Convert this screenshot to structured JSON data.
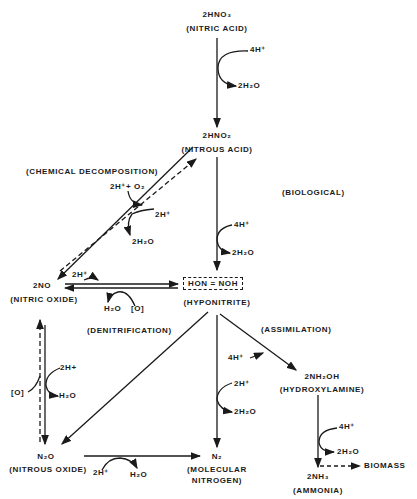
{
  "compounds": {
    "nitric_acid": {
      "formula": "2HNO₃",
      "name": "(NITRIC ACID)"
    },
    "nitrous_acid": {
      "formula": "2HNO₂",
      "name": "(NITROUS ACID)"
    },
    "nitric_oxide": {
      "formula": "2NO",
      "name": "(NITRIC OXIDE)"
    },
    "hyponitrite": {
      "formula": "HON = NOH",
      "name": "(HYPONITRITE)"
    },
    "hydroxylamine": {
      "formula": "2NH₂OH",
      "name": "(HYDROXYLAMINE)"
    },
    "nitrous_oxide": {
      "formula": "N₂O",
      "name": "(NITROUS OXIDE)"
    },
    "molecular_nitrogen": {
      "formula": "N₂",
      "name": "(MOLECULAR",
      "name2": "NITROGEN)"
    },
    "ammonia": {
      "formula": "2NH₃",
      "name": "(AMMONIA)"
    },
    "biomass": {
      "label": "BIOMASS"
    }
  },
  "processes": {
    "chemical_decomposition": "(CHEMICAL DECOMPOSITION)",
    "biological": "(BIOLOGICAL)",
    "denitrification": "(DENITRIFICATION)",
    "assimilation": "(ASSIMILATION)"
  },
  "reagents": {
    "hno3_in": "4H⁺",
    "hno3_out": "2H₂O",
    "chem_in": "2H⁺+ O₂",
    "chem_in2": "2H⁺",
    "chem_out": "2H₂O",
    "hno2_in": "4H⁺",
    "hno2_out": "2H₂O",
    "no_in": "2H⁺",
    "no_out": "H₂O",
    "no_o": "[O]",
    "n2o_o": "[O]",
    "n2o_in": "2H+",
    "n2o_out": "H₂O",
    "hypo_n2_in": "2H⁺",
    "hypo_n2_out": "2H₂O",
    "assim_in": "4H⁺",
    "nh2oh_in": "4H⁺",
    "nh2oh_out": "2H₂O",
    "n2o_n2_in": "2H⁺",
    "n2o_n2_out": "H₂O"
  }
}
